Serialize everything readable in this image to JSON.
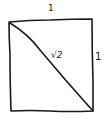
{
  "diagram": {
    "shape": "square",
    "labels": {
      "top_side": "1",
      "right_side": "1",
      "diagonal": "√2"
    },
    "colors": {
      "stroke": "#1a1a1a",
      "background": "#ffffff"
    }
  }
}
